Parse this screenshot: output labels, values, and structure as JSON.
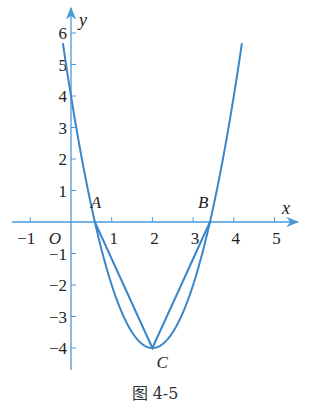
{
  "caption": "图 4-5",
  "colors": {
    "curve": "#3a86c8",
    "axis": "#4a9ad8",
    "text": "#222222"
  },
  "chart_data": {
    "type": "line",
    "title": "",
    "caption": "图 4-5",
    "xlabel": "x",
    "ylabel": "y",
    "origin_label": "O",
    "xlim": [
      -1.3,
      5.6
    ],
    "ylim": [
      -4.5,
      6.3
    ],
    "x_ticks": [
      -1,
      1,
      2,
      3,
      4,
      5
    ],
    "y_ticks": [
      -4,
      -3,
      -2,
      -1,
      1,
      2,
      3,
      4,
      5,
      6
    ],
    "grid": false,
    "series": [
      {
        "name": "parabola y = 2x^2 - 8x + 4",
        "kind": "curve",
        "x_range": [
          -0.2,
          4.2
        ]
      },
      {
        "name": "segments A-C-B",
        "kind": "polyline",
        "x": [
          0.586,
          2,
          3.414
        ],
        "y": [
          0,
          -4,
          0
        ]
      }
    ],
    "points": [
      {
        "label": "A",
        "x": 0.586,
        "y": 0
      },
      {
        "label": "B",
        "x": 3.414,
        "y": 0
      },
      {
        "label": "C",
        "x": 2,
        "y": -4
      }
    ]
  }
}
